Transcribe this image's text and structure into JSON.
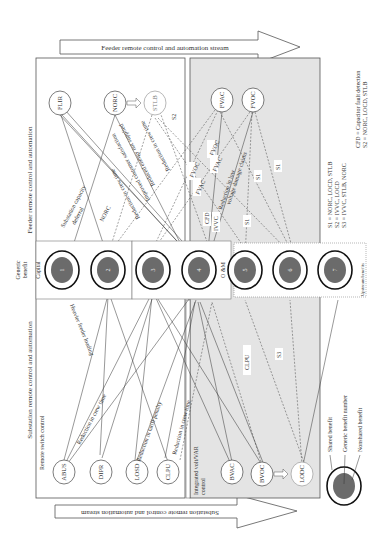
{
  "colors": {
    "gray_panel": "#e4e4e4",
    "circle_fill": "#6b6b6b",
    "line": "#333333",
    "frame": "#555555"
  },
  "streams": {
    "feeder": "Feeder remote control and automation stream",
    "substation": "Substation remote control and automation stream"
  },
  "sections": {
    "feeder_section": "Feeder remote control and automation",
    "substation_section": "Substation remote control and automation",
    "remote_switch": "Remote switch control",
    "ivvc_line1": "Integrated volt/VAR",
    "ivvc_line2": "control"
  },
  "benefit_strip": {
    "header_line1": "Generic",
    "header_line2": "benefit",
    "capital": "Capital",
    "om": "O &M",
    "upstream": "Upstream benefits",
    "benefits": [
      "1",
      "2",
      "3",
      "4",
      "5",
      "6",
      "7"
    ]
  },
  "feeder_nodes": [
    "FLIR",
    "NORC",
    "STLB",
    "FVAC",
    "FVOC"
  ],
  "substation_nodes": [
    "ABUS",
    "DIPR",
    "LOSD",
    "CLPU",
    "BVAC",
    "BVOC",
    "LODC"
  ],
  "edge_labels": {
    "substation_capacity_1": "Substation capacity",
    "substation_capacity_2": "deferral",
    "norc": "NORC",
    "reduction_crew_time_1": "Reduction in crew time",
    "improved_customer": "Improved customer satisfaction",
    "reduced_energy": "Reduced energy not supplied",
    "reduction_crew_time_2": "Reduction in crew time",
    "heavier_feeder": "Heavier feeder loading",
    "reduction_crew_time_3": "Reduction in crew time",
    "reduction_tariff": "Reduction in tariff penalty",
    "reduction_crew_time_4": "Reduction in crew time",
    "fvoc_a": "FVOC",
    "fvoc_b": "FVOC",
    "fvac_a": "FVAC",
    "fvac_b": "FVAC",
    "cfd": "CFD",
    "ivvc": "IVVC",
    "low_voltage_1": "Reduction in low",
    "low_voltage_2": "voltage damage claims",
    "s1_a": "S1",
    "s1_b": "S1",
    "s1_c": "S1",
    "s2": "S2",
    "s3": "S3",
    "clpu": "CLPU"
  },
  "legend_right": {
    "s1": "S1 = NORC, LOCD, STLB",
    "s2": "S2 = IVVC, LOCD",
    "s3": "S3 = IVVC, STLB, NORC",
    "cfd": "CFD = Capacitor fault detection",
    "s2b": "S2 = NORC, LOCD, STLB"
  },
  "legend_bottom": {
    "shared": "Shared benefit",
    "generic_number": "Generic benefit number",
    "nonshared": "Nonshared benefit"
  }
}
